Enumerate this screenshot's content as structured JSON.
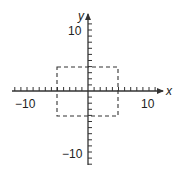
{
  "chart_data": {
    "type": "line",
    "title": "",
    "xlabel": "x",
    "ylabel": "y",
    "xlim": [
      -12,
      12
    ],
    "ylim": [
      -12,
      12
    ],
    "x_tick_labels": [
      "-10",
      "10"
    ],
    "y_tick_labels": [
      "10",
      "-10"
    ],
    "tick_spacing": 1,
    "grid": false,
    "shapes": [
      {
        "name": "dashed-rectangle",
        "style": "dashed",
        "x_range": [
          -5,
          5
        ],
        "y_range": [
          -4,
          4
        ],
        "corners": [
          [
            -5,
            4
          ],
          [
            5,
            4
          ],
          [
            5,
            -4
          ],
          [
            -5,
            -4
          ]
        ]
      }
    ]
  },
  "labels": {
    "x_axis": "x",
    "y_axis": "y",
    "x_neg10": "−10",
    "x_pos10": "10",
    "y_pos10": "10",
    "y_neg10": "−10"
  },
  "colors": {
    "axis": "#333333",
    "rect": "#333333",
    "background": "#ffffff"
  }
}
